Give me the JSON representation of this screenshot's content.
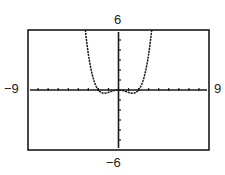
{
  "chart_data": {
    "type": "line",
    "title": "",
    "xlabel": "",
    "ylabel": "",
    "xlim": [
      -9,
      9
    ],
    "ylim": [
      -6,
      6
    ],
    "xscl": 1,
    "yscl": 1,
    "grid": false,
    "legend": null,
    "window_labels": {
      "ymax": "6",
      "ymin": "−6",
      "xmin": "−9",
      "xmax": "9"
    },
    "series": [
      {
        "name": "f(x)",
        "description": "Even quartic curve, W-shaped: local max 0 at origin, minima near x=±1.4 (y≈−0.33), zeros at x=0 and ±2, rising steeply to exit the window top near x=±3.3",
        "x": [
          -3.3,
          -3.0,
          -2.5,
          -2.0,
          -1.75,
          -1.5,
          -1.414,
          -1.25,
          -1.0,
          -0.75,
          -0.5,
          -0.25,
          0,
          0.25,
          0.5,
          0.75,
          1.0,
          1.25,
          1.414,
          1.5,
          1.75,
          2.0,
          2.5,
          3.0,
          3.3
        ],
        "y": [
          6.0,
          3.6,
          1.13,
          0.0,
          -0.23,
          -0.32,
          -0.33,
          -0.31,
          -0.24,
          -0.15,
          -0.08,
          -0.02,
          0.0,
          -0.02,
          -0.08,
          -0.15,
          -0.24,
          -0.31,
          -0.33,
          -0.32,
          -0.23,
          0.0,
          1.13,
          3.6,
          6.0
        ]
      }
    ]
  }
}
